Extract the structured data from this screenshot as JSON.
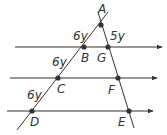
{
  "diagram": {
    "type": "geometry-parallel-lines-triangle",
    "colors": {
      "line": "#333333",
      "point": "#333333",
      "text": "#333333"
    },
    "points": [
      {
        "name": "A",
        "x": 101,
        "y": 25,
        "lx": 98,
        "ly": 13
      },
      {
        "name": "B",
        "x": 84,
        "y": 47,
        "lx": 81,
        "ly": 62
      },
      {
        "name": "G",
        "x": 108,
        "y": 47,
        "lx": 97,
        "ly": 62
      },
      {
        "name": "C",
        "x": 58,
        "y": 78,
        "lx": 57,
        "ly": 93
      },
      {
        "name": "F",
        "x": 118,
        "y": 78,
        "lx": 108,
        "ly": 94
      },
      {
        "name": "D",
        "x": 32,
        "y": 111,
        "lx": 30,
        "ly": 126
      },
      {
        "name": "E",
        "x": 129,
        "y": 111,
        "lx": 118,
        "ly": 126
      }
    ],
    "segment_labels": [
      {
        "text": "6y",
        "x": 73,
        "y": 40
      },
      {
        "text": "5y",
        "x": 110,
        "y": 40
      },
      {
        "text": "6y",
        "x": 52,
        "y": 66
      },
      {
        "text": "6y",
        "x": 27,
        "y": 99
      }
    ],
    "parallel_lines": [
      {
        "x1": 15,
        "y": 47,
        "x2": 162
      },
      {
        "x1": 10,
        "y": 78,
        "x2": 157
      },
      {
        "x1": 7,
        "y": 111,
        "x2": 153
      }
    ],
    "transversals": [
      {
        "x1": 17,
        "y1": 130,
        "x2": 108,
        "y2": 12
      },
      {
        "x1": 98,
        "y1": 12,
        "x2": 134,
        "y2": 128
      }
    ]
  }
}
